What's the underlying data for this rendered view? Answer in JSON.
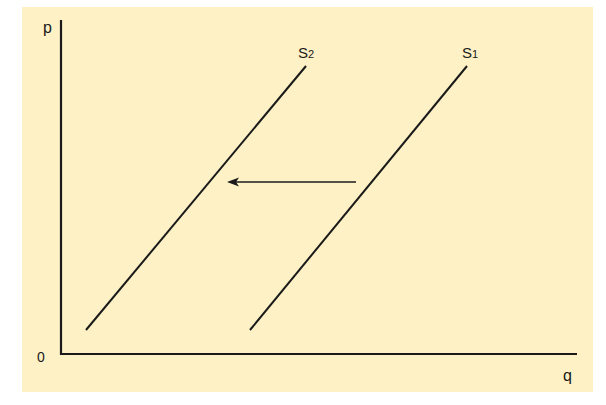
{
  "diagram": {
    "type": "supply-shift",
    "background_color": "#fdf1c5",
    "line_color": "#1a1a1a",
    "axes": {
      "y_label": "p",
      "x_label": "q",
      "origin_label": "0"
    },
    "curves": [
      {
        "id": "S1",
        "label_main": "S",
        "label_sub": "1",
        "from": [
          250,
          330
        ],
        "to": [
          467,
          66
        ]
      },
      {
        "id": "S2",
        "label_main": "S",
        "label_sub": "2",
        "from": [
          86,
          330
        ],
        "to": [
          306,
          66
        ]
      }
    ],
    "arrow": {
      "from": [
        356,
        182
      ],
      "to": [
        228,
        182
      ],
      "direction": "left",
      "meaning": "supply shifts from S1 to S2"
    }
  }
}
